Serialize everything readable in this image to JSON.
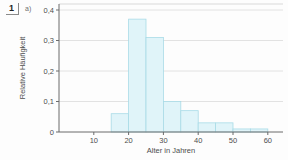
{
  "page": {
    "exercise_number": "1",
    "part_label": "a)"
  },
  "colors": {
    "bar_fill": "#e0f4f9",
    "bar_border": "#a9dbe7",
    "grid_line": "#dadada",
    "frame_line": "#cfcfcf",
    "axis_line": "#6b6b6b",
    "text": "#4d4d4d"
  },
  "chart_data": {
    "type": "bar",
    "title": "",
    "xlabel": "Alter in Jahren",
    "ylabel": "Relative Häufigkeit",
    "grid": true,
    "legend": false,
    "xlim": [
      0,
      64
    ],
    "ylim": [
      0,
      0.42
    ],
    "x_ticks": [
      10,
      20,
      30,
      40,
      50,
      60
    ],
    "y_ticks": [
      {
        "label": "0",
        "value": 0
      },
      {
        "label": "0,1",
        "value": 0.1
      },
      {
        "label": "0,2",
        "value": 0.2
      },
      {
        "label": "0,3",
        "value": 0.3
      },
      {
        "label": "0,4",
        "value": 0.4
      }
    ],
    "bins": [
      {
        "from": 15,
        "to": 20,
        "value": 0.06
      },
      {
        "from": 20,
        "to": 25,
        "value": 0.37
      },
      {
        "from": 25,
        "to": 30,
        "value": 0.31
      },
      {
        "from": 30,
        "to": 35,
        "value": 0.1
      },
      {
        "from": 35,
        "to": 40,
        "value": 0.07
      },
      {
        "from": 40,
        "to": 45,
        "value": 0.03
      },
      {
        "from": 45,
        "to": 50,
        "value": 0.03
      },
      {
        "from": 50,
        "to": 55,
        "value": 0.01
      },
      {
        "from": 55,
        "to": 60,
        "value": 0.01
      }
    ]
  }
}
